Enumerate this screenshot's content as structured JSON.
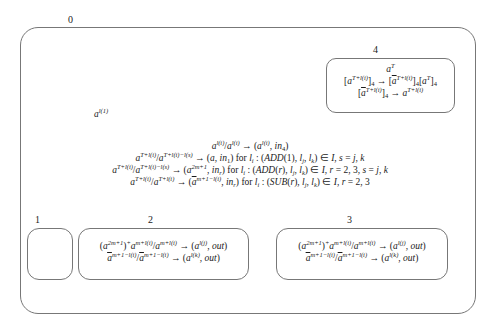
{
  "membranes": {
    "skin": {
      "label": "0"
    },
    "m1": {
      "label": "1"
    },
    "m2": {
      "label": "2"
    },
    "m3": {
      "label": "3"
    },
    "m4": {
      "label": "4"
    }
  },
  "skin_object": "a^{l(1)}",
  "skin_rules": [
    "a^{l(i)}/a^{l(i)} → (a^{l(i)}, in_4)",
    "a^{T+l(i)}/a^{T+l(i)-l(s)} → (a, in_1) for l_i : (ADD(1), l_j, l_k) ∈ I, s = j, k",
    "a^{T+l(i)}/a^{T+l(i)-l(s)} → (a^{2m+1}, in_r) for l_i : (ADD(r), l_j, l_k) ∈ I, r = 2, 3, s = j, k",
    "a^{T+l(i)}/a^{T+l(i)} → (ā^{m+1-l(i)}, in_r) for l_i : (SUB(r), l_j, l_k) ∈ I, r = 2, 3"
  ],
  "m4_contents": [
    "a^T",
    "[a^{T+l(i)}]_4 → [ā^{T+l(i)}]_4[a^T]_4",
    "[ā^{T+l(i)}]_4 → a^{T+l(i)}"
  ],
  "m2_rules": [
    "(a^{2m+1})^+ a^{m+l(i)}/a^{m+l(i)} → (a^{l(j)}, out)",
    "ā^{m+1-l(i)}/ā^{m+1-l(i)} → (a^{l(k)}, out)"
  ],
  "m3_rules": [
    "(a^{2m+1})^+ a^{m+l(i)}/a^{m+l(i)} → (a^{l(j)}, out)",
    "ā^{m+1-l(i)}/ā^{m+1-l(i)} → (a^{l(k)}, out)"
  ]
}
